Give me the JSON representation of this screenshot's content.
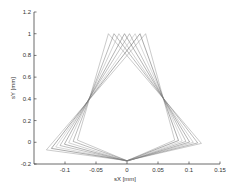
{
  "chart_data": {
    "type": "line",
    "title": "",
    "xlabel": "sX [mm]",
    "ylabel": "sY [mm]",
    "xlim": [
      -0.15,
      0.15
    ],
    "ylim": [
      -0.2,
      1.2
    ],
    "xticks": [
      -0.1,
      -0.05,
      0,
      0.05,
      0.1,
      0.15
    ],
    "xtick_labels": [
      "-0.1",
      "-0.05",
      "0",
      "0.05",
      "0.1",
      "0.15"
    ],
    "yticks": [
      -0.2,
      0,
      0.2,
      0.4,
      0.6,
      0.8,
      1,
      1.2
    ],
    "ytick_labels": [
      "-0.2",
      "0",
      "0.2",
      "0.4",
      "0.6",
      "0.8",
      "1",
      "1.2"
    ],
    "grid": false,
    "legend": "none",
    "line_color": "#555555",
    "series": [
      {
        "name": "loop-1",
        "x": [
          -0.03,
          -0.08,
          0.0,
          0.12,
          -0.03
        ],
        "y": [
          1.0,
          0.02,
          -0.17,
          -0.01,
          1.0
        ]
      },
      {
        "name": "loop-2",
        "x": [
          -0.021,
          -0.087,
          0.0,
          0.114,
          -0.021
        ],
        "y": [
          1.0,
          0.008,
          -0.17,
          -0.006,
          1.0
        ]
      },
      {
        "name": "loop-3",
        "x": [
          -0.013,
          -0.094,
          0.0,
          0.107,
          -0.013
        ],
        "y": [
          1.0,
          -0.005,
          -0.172,
          -0.001,
          1.0
        ]
      },
      {
        "name": "loop-4",
        "x": [
          -0.004,
          -0.101,
          0.0,
          0.101,
          -0.004
        ],
        "y": [
          1.0,
          -0.018,
          -0.173,
          0.003,
          1.0
        ]
      },
      {
        "name": "loop-5",
        "x": [
          0.004,
          -0.108,
          0.0,
          0.095,
          0.004
        ],
        "y": [
          1.0,
          -0.03,
          -0.173,
          0.008,
          1.0
        ]
      },
      {
        "name": "loop-6",
        "x": [
          0.013,
          -0.115,
          0.0,
          0.089,
          0.013
        ],
        "y": [
          1.0,
          -0.043,
          -0.172,
          0.012,
          1.0
        ]
      },
      {
        "name": "loop-7",
        "x": [
          0.021,
          -0.122,
          0.0,
          0.083,
          0.021
        ],
        "y": [
          1.0,
          -0.056,
          -0.17,
          0.016,
          1.0
        ]
      },
      {
        "name": "loop-8",
        "x": [
          0.03,
          -0.13,
          0.0,
          0.077,
          0.03
        ],
        "y": [
          1.0,
          -0.07,
          -0.17,
          0.02,
          1.0
        ]
      }
    ]
  }
}
